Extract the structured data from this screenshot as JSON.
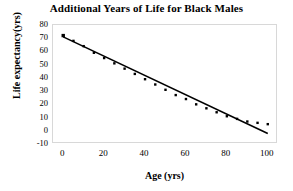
{
  "chart_data": {
    "type": "scatter",
    "title": "Additional Years of Life for Black Males",
    "xlabel": "Age (yrs)",
    "ylabel": "Life expectancy(yrs)",
    "xlim": [
      -5,
      105
    ],
    "ylim": [
      -10,
      80
    ],
    "xticks": [
      0,
      20,
      40,
      60,
      80,
      100
    ],
    "yticks": [
      -10,
      0,
      10,
      20,
      30,
      40,
      50,
      60,
      70,
      80
    ],
    "grid": false,
    "legend": false,
    "series": [
      {
        "name": "Life expectancy",
        "marker": "square",
        "color": "#000000",
        "x": [
          0,
          5,
          10,
          15,
          20,
          25,
          30,
          35,
          40,
          45,
          50,
          55,
          60,
          65,
          70,
          75,
          80,
          85,
          90,
          95,
          100
        ],
        "y": [
          72,
          68,
          64,
          59,
          55,
          51,
          47,
          43,
          39,
          35,
          31,
          27,
          24,
          20,
          17,
          14,
          11,
          9,
          7,
          6,
          5
        ]
      }
    ],
    "trendline": {
      "name": "linear fit",
      "color": "#000000",
      "x": [
        0,
        100
      ],
      "y": [
        71,
        -2
      ]
    }
  }
}
